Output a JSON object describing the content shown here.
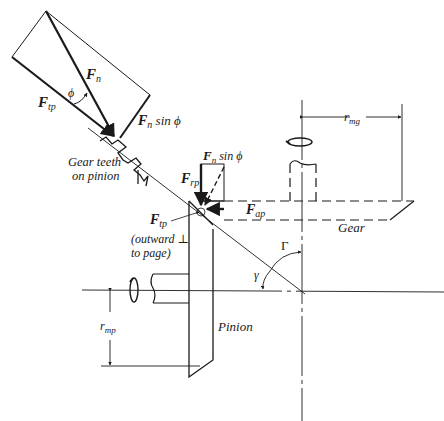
{
  "diagram": {
    "type": "bevel-gear-force-diagram",
    "labels": {
      "fn": "F",
      "fn_sub": "n",
      "ftp": "F",
      "ftp_sub": "tp",
      "phi": "ϕ",
      "fn_sin_phi_top": "F",
      "fn_sin_phi_top_sub": "n",
      "fn_sin_phi_top_rest": " sin ϕ",
      "gear_teeth_line1": "Gear teeth",
      "gear_teeth_line2": "on pinion",
      "frp": "F",
      "frp_sub": "rp",
      "fn_sin_phi_mid": "F",
      "fn_sin_phi_mid_sub": "n",
      "fn_sin_phi_mid_rest": " sin ϕ",
      "fap": "F",
      "fap_sub": "ap",
      "ftp2": "F",
      "ftp2_sub": "tp",
      "outward_line1": "(outward ⊥",
      "outward_line2": "to page)",
      "rmg": "r",
      "rmg_sub": "mg",
      "gear": "Gear",
      "gamma_upper": "Γ",
      "gamma_lower": "γ",
      "rmp": "r",
      "rmp_sub": "mp",
      "pinion": "Pinion"
    },
    "colors": {
      "ink": "#1a1a1a",
      "background": "#ffffff"
    }
  }
}
